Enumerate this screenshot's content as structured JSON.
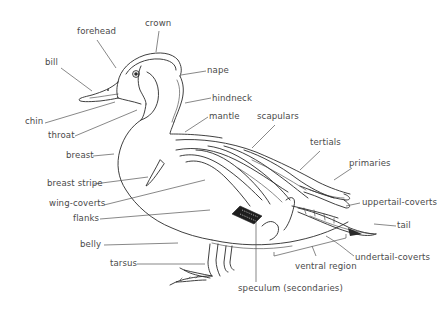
{
  "diagram": {
    "ink_color": "#2a2a2a",
    "label_color": "#4a4a4a",
    "background": "#ffffff",
    "labels": {
      "crown": "crown",
      "forehead": "forehead",
      "bill": "bill",
      "nape": "nape",
      "hindneck": "hindneck",
      "mantle": "mantle",
      "chin": "chin",
      "throat": "throat",
      "scapulars": "scapulars",
      "tertials": "tertials",
      "breast": "breast",
      "primaries": "primaries",
      "breast_stripe": "breast stripe",
      "uppertail_coverts": "uppertail-coverts",
      "wing_coverts": "wing-coverts",
      "tail": "tail",
      "flanks": "flanks",
      "undertail_coverts": "undertail-coverts",
      "belly": "belly",
      "ventral_region": "ventral region",
      "tarsus": "tarsus",
      "speculum": "speculum (secondaries)"
    }
  }
}
